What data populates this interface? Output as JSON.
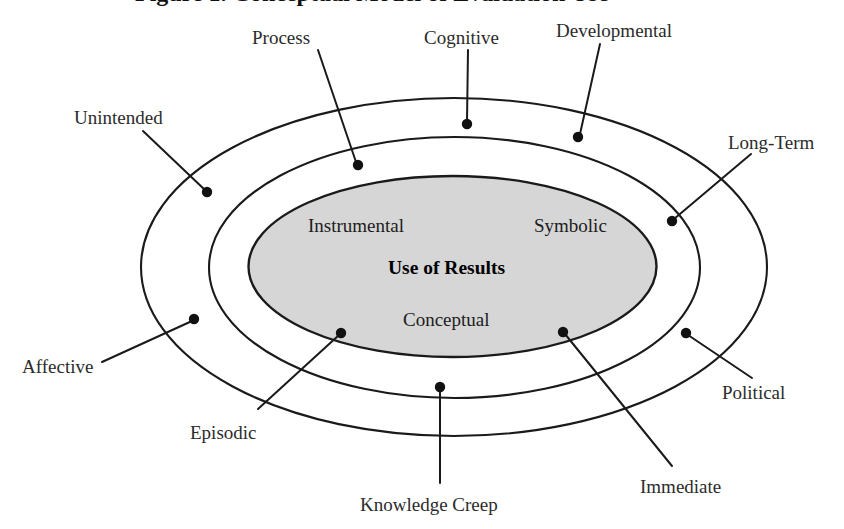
{
  "figure": {
    "title_partial": "Figure 1. Conceptual Model of Evaluation Use",
    "core": {
      "center_label": "Use of Results",
      "top_left_label": "Instrumental",
      "top_right_label": "Symbolic",
      "bottom_label": "Conceptual"
    },
    "colors": {
      "core_fill": "#d6d6d6",
      "outline": "#1a1a1a",
      "background": "#ffffff",
      "text": "#2b2b2b"
    },
    "rings": [
      {
        "name": "inner-core-ellipse",
        "cx": 452.5,
        "cy": 266.5,
        "rx": 204,
        "ry": 90.5,
        "filled": true
      },
      {
        "name": "middle-ring-ellipse",
        "cx": 454.5,
        "cy": 267.5,
        "rx": 245.5,
        "ry": 130.5,
        "filled": false
      },
      {
        "name": "outer-ring-ellipse",
        "cx": 454,
        "cy": 267,
        "rx": 313,
        "ry": 169,
        "filled": false
      }
    ],
    "callouts": [
      {
        "id": "process",
        "label": "Process",
        "label_x": 252,
        "label_y": 28,
        "text_anchor": "start",
        "dot_x": 358,
        "dot_y": 165,
        "line_x1": 318,
        "line_y1": 50,
        "line_x2": 356,
        "line_y2": 162,
        "ring": "middle"
      },
      {
        "id": "cognitive",
        "label": "Cognitive",
        "label_x": 424,
        "label_y": 28,
        "text_anchor": "start",
        "dot_x": 467,
        "dot_y": 124,
        "line_x1": 468,
        "line_y1": 50,
        "line_x2": 467,
        "line_y2": 121,
        "ring": "outer"
      },
      {
        "id": "developmental",
        "label": "Developmental",
        "label_x": 556,
        "label_y": 21,
        "text_anchor": "start",
        "dot_x": 578,
        "dot_y": 137,
        "line_x1": 600,
        "line_y1": 44,
        "line_x2": 580,
        "line_y2": 134,
        "ring": "outer"
      },
      {
        "id": "unintended",
        "label": "Unintended",
        "label_x": 74,
        "label_y": 108,
        "text_anchor": "start",
        "dot_x": 207,
        "dot_y": 192,
        "line_x1": 143,
        "line_y1": 131,
        "line_x2": 205,
        "line_y2": 190,
        "ring": "middle"
      },
      {
        "id": "long-term",
        "label": "Long-Term",
        "label_x": 728,
        "label_y": 133,
        "text_anchor": "start",
        "dot_x": 672,
        "dot_y": 221,
        "line_x1": 751,
        "line_y1": 154,
        "line_x2": 674,
        "line_y2": 219,
        "ring": "middle"
      },
      {
        "id": "affective",
        "label": "Affective",
        "label_x": 22,
        "label_y": 357,
        "text_anchor": "start",
        "dot_x": 194,
        "dot_y": 319,
        "line_x1": 102,
        "line_y1": 362,
        "line_x2": 192,
        "line_y2": 321,
        "ring": "middle"
      },
      {
        "id": "episodic",
        "label": "Episodic",
        "label_x": 190,
        "label_y": 423,
        "text_anchor": "start",
        "dot_x": 341,
        "dot_y": 333,
        "line_x1": 258,
        "line_y1": 409,
        "line_x2": 339,
        "line_y2": 335,
        "ring": "inner"
      },
      {
        "id": "political",
        "label": "Political",
        "label_x": 722,
        "label_y": 383,
        "text_anchor": "start",
        "dot_x": 686,
        "dot_y": 333,
        "line_x1": 752,
        "line_y1": 378,
        "line_x2": 688,
        "line_y2": 335,
        "ring": "middle"
      },
      {
        "id": "immediate",
        "label": "Immediate",
        "label_x": 640,
        "label_y": 477,
        "text_anchor": "start",
        "dot_x": 563,
        "dot_y": 332,
        "line_x1": 672,
        "line_y1": 466,
        "line_x2": 565,
        "line_y2": 334,
        "ring": "inner"
      },
      {
        "id": "knowledge-creep",
        "label": "Knowledge Creep",
        "label_x": 360,
        "label_y": 495,
        "text_anchor": "start",
        "dot_x": 440,
        "dot_y": 387,
        "line_x1": 440,
        "line_y1": 483,
        "line_x2": 440,
        "line_y2": 390,
        "ring": "middle"
      }
    ],
    "core_label_positions": {
      "instrumental": {
        "x": 308,
        "y": 216
      },
      "symbolic": {
        "x": 534,
        "y": 216
      },
      "use_of_results": {
        "x": 388,
        "y": 258
      },
      "conceptual": {
        "x": 403,
        "y": 310
      }
    }
  }
}
